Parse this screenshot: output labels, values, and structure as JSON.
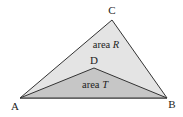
{
  "diagram": {
    "points": {
      "A": {
        "label": "A",
        "x": 20,
        "y": 98,
        "lx": 15,
        "ly": 109
      },
      "B": {
        "label": "B",
        "x": 167,
        "y": 98,
        "lx": 172,
        "ly": 108
      },
      "C": {
        "label": "C",
        "x": 112,
        "y": 20,
        "lx": 112,
        "ly": 14
      },
      "D": {
        "label": "D",
        "x": 94,
        "y": 68,
        "lx": 94,
        "ly": 64
      }
    },
    "regions": {
      "R": {
        "prefix": "area ",
        "var": "R",
        "fill": "#e4e4e4"
      },
      "T": {
        "prefix": "area ",
        "var": "T",
        "fill": "#c6c6c6"
      }
    },
    "stroke": "#333333"
  }
}
